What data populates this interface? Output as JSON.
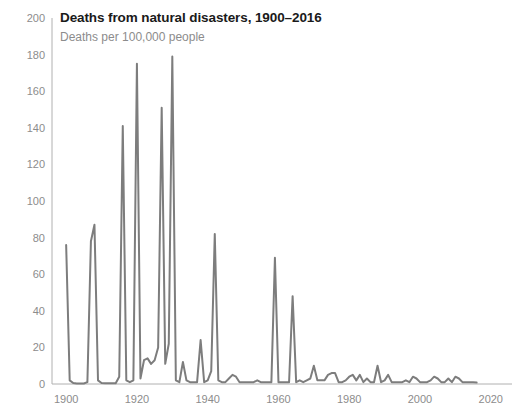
{
  "header": {
    "title": "Deaths from natural disasters, 1900–2016",
    "subtitle": "Deaths per 100,000 people"
  },
  "colors": {
    "line": "#7d7d7d",
    "axis": "#b0b0b0",
    "tick_text": "#8c8c8c",
    "title_text": "#1a1a1a",
    "subtitle_text": "#8c8c8c",
    "background": "#ffffff"
  },
  "chart_data": {
    "type": "line",
    "title": "Deaths from natural disasters, 1900–2016",
    "subtitle": "Deaths per 100,000 people",
    "xlabel": "",
    "ylabel": "Deaths per 100,000 people",
    "xlim": [
      1896,
      2026
    ],
    "ylim": [
      0,
      200
    ],
    "xticks": [
      1900,
      1920,
      1940,
      1960,
      1980,
      2000,
      2020
    ],
    "yticks": [
      0,
      20,
      40,
      60,
      80,
      100,
      120,
      140,
      160,
      180,
      200
    ],
    "grid": false,
    "legend": "none",
    "series": [
      {
        "name": "Deaths per 100,000 people",
        "color": "#7d7d7d",
        "x": [
          1900,
          1901,
          1902,
          1903,
          1904,
          1905,
          1906,
          1907,
          1908,
          1909,
          1910,
          1911,
          1912,
          1913,
          1914,
          1915,
          1916,
          1917,
          1918,
          1919,
          1920,
          1921,
          1922,
          1923,
          1924,
          1925,
          1926,
          1927,
          1928,
          1929,
          1930,
          1931,
          1932,
          1933,
          1934,
          1935,
          1936,
          1937,
          1938,
          1939,
          1940,
          1941,
          1942,
          1943,
          1944,
          1945,
          1946,
          1947,
          1948,
          1949,
          1950,
          1951,
          1952,
          1953,
          1954,
          1955,
          1956,
          1957,
          1958,
          1959,
          1960,
          1961,
          1962,
          1963,
          1964,
          1965,
          1966,
          1967,
          1968,
          1969,
          1970,
          1971,
          1972,
          1973,
          1974,
          1975,
          1976,
          1977,
          1978,
          1979,
          1980,
          1981,
          1982,
          1983,
          1984,
          1985,
          1986,
          1987,
          1988,
          1989,
          1990,
          1991,
          1992,
          1993,
          1994,
          1995,
          1996,
          1997,
          1998,
          1999,
          2000,
          2001,
          2002,
          2003,
          2004,
          2005,
          2006,
          2007,
          2008,
          2009,
          2010,
          2011,
          2012,
          2013,
          2014,
          2015,
          2016
        ],
        "values": [
          76,
          2,
          0.5,
          0.3,
          0.3,
          0.3,
          1,
          78,
          87,
          2,
          0.5,
          0.4,
          0.4,
          0.4,
          0.4,
          4,
          141,
          2,
          1,
          2,
          175,
          3,
          13,
          14,
          11,
          13,
          20,
          151,
          11,
          22,
          179,
          2,
          1,
          12,
          2,
          1,
          1,
          1,
          24,
          1,
          2,
          7,
          82,
          2,
          1,
          1,
          3,
          5,
          4,
          1,
          1,
          1,
          1,
          1,
          2,
          1,
          1,
          1,
          1,
          69,
          1,
          1,
          1,
          1,
          48,
          1,
          2,
          1,
          2,
          3,
          10,
          2,
          2,
          2,
          5,
          6,
          6,
          1,
          1,
          2,
          4,
          5,
          2,
          5,
          1,
          3,
          1,
          1,
          10,
          1,
          2,
          5,
          1,
          1,
          1,
          1,
          2,
          1,
          4,
          3,
          1,
          1,
          1,
          2,
          4,
          3,
          1,
          1,
          3,
          1,
          4,
          3,
          1,
          1,
          1,
          1,
          0.8
        ]
      }
    ]
  }
}
